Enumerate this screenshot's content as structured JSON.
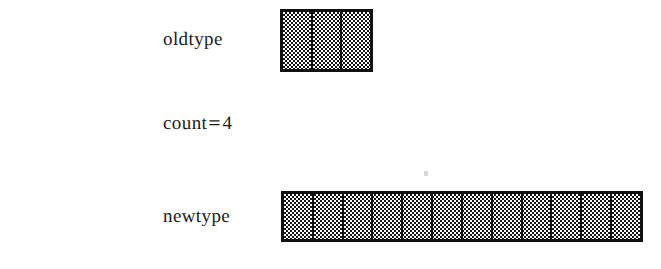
{
  "figure": {
    "background_color": "#ffffff",
    "ink_color": "#1b1b1b",
    "fill_color": "#151515",
    "border_color": "#111111"
  },
  "rows": [
    {
      "label": "oldtype",
      "block_name": "oldtype-block",
      "cells": 3,
      "fill": "checkered"
    },
    {
      "label": "newtype",
      "block_name": "newtype-block",
      "cells": 12,
      "fill": "checkered"
    }
  ],
  "annotation": {
    "text": "count = 4",
    "variable": "count",
    "operator": "=",
    "value": "4"
  },
  "artifact": {
    "name": "scan-speck",
    "color": "#d8d8d8"
  }
}
